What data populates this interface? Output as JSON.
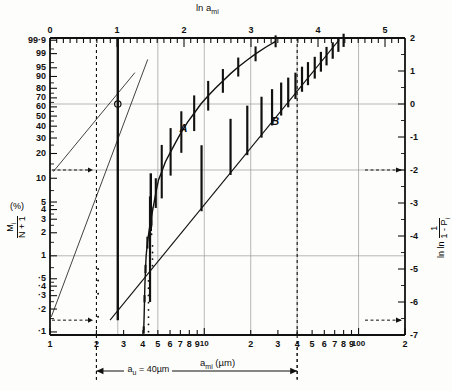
{
  "figure": {
    "top_axis_title": "ln a",
    "top_axis_title_sub": "mi",
    "bottom_axis_title": "a",
    "bottom_axis_title_sub": "mi",
    "bottom_axis_units": "(µm)",
    "left_axis_title_num": "M",
    "left_axis_title_num_sub": "i",
    "left_axis_title_den": "N + 1",
    "left_axis_title_pct": "(%)",
    "right_axis_title": "ln ln",
    "right_axis_title_num": "1",
    "right_axis_title_den": "1 - P",
    "right_axis_title_den_sub": "i",
    "annotation_label": "a",
    "annotation_label_sub": "u",
    "annotation_value": "= 40µm",
    "curve_a_label": "A",
    "curve_b_label": "B"
  },
  "chart_data": {
    "type": "scatter",
    "xlabel": "a_mi (µm)",
    "ylabel": "M_i/(N+1) (%)",
    "x_scale": "log10",
    "xlim": [
      1,
      200
    ],
    "top_xlabel": "ln a_mi",
    "top_xlim": [
      0,
      5.2983
    ],
    "right_ylabel": "ln ln (1/(1-P_i))",
    "right_ylim": [
      -7,
      2
    ],
    "grid": true,
    "legend": [
      "A",
      "B"
    ],
    "bottom_ticks_major": [
      {
        "x": 1,
        "label": "1"
      },
      {
        "x": 2,
        "label": "2"
      },
      {
        "x": 3,
        "label": "3"
      },
      {
        "x": 4,
        "label": "4"
      },
      {
        "x": 5,
        "label": "5"
      },
      {
        "x": 6,
        "label": "6"
      },
      {
        "x": 7,
        "label": "7"
      },
      {
        "x": 8,
        "label": "8"
      },
      {
        "x": 9,
        "label": "9"
      },
      {
        "x": 10,
        "label": "10"
      },
      {
        "x": 20,
        "label": "2"
      },
      {
        "x": 30,
        "label": "3"
      },
      {
        "x": 40,
        "label": "4"
      },
      {
        "x": 50,
        "label": "5"
      },
      {
        "x": 60,
        "label": "6"
      },
      {
        "x": 70,
        "label": "7"
      },
      {
        "x": 80,
        "label": "8"
      },
      {
        "x": 90,
        "label": "9"
      },
      {
        "x": 100,
        "label": "100"
      },
      {
        "x": 200,
        "label": "2"
      }
    ],
    "top_ticks_major": [
      {
        "v": 0,
        "label": "0"
      },
      {
        "v": 1,
        "label": "1"
      },
      {
        "v": 2,
        "label": "2"
      },
      {
        "v": 3,
        "label": "3"
      },
      {
        "v": 4,
        "label": "4"
      },
      {
        "v": 5,
        "label": "5"
      }
    ],
    "left_ticks": [
      {
        "p": 99.9,
        "label": "99·9"
      },
      {
        "p": 99,
        "label": "99"
      },
      {
        "p": 95,
        "label": "95"
      },
      {
        "p": 90,
        "label": "90"
      },
      {
        "p": 80,
        "label": "80"
      },
      {
        "p": 70,
        "label": "70"
      },
      {
        "p": 60,
        "label": "60"
      },
      {
        "p": 50,
        "label": "50"
      },
      {
        "p": 40,
        "label": "40"
      },
      {
        "p": 30,
        "label": "30"
      },
      {
        "p": 20,
        "label": "20"
      },
      {
        "p": 10,
        "label": "10"
      },
      {
        "p": 5,
        "label": "5"
      },
      {
        "p": 4,
        "label": "4"
      },
      {
        "p": 3,
        "label": "3"
      },
      {
        "p": 2,
        "label": "2"
      },
      {
        "p": 1,
        "label": "1"
      },
      {
        "p": 0.5,
        "label": "·5"
      },
      {
        "p": 0.4,
        "label": "·4"
      },
      {
        "p": 0.3,
        "label": "·3"
      },
      {
        "p": 0.2,
        "label": "·2"
      },
      {
        "p": 0.1,
        "label": "·1"
      }
    ],
    "right_ticks": [
      {
        "v": 2,
        "label": "2"
      },
      {
        "v": 1,
        "label": "1"
      },
      {
        "v": 0,
        "label": "0"
      },
      {
        "v": -1,
        "label": "-1"
      },
      {
        "v": -2,
        "label": "-2"
      },
      {
        "v": -3,
        "label": "-3"
      },
      {
        "v": -4,
        "label": "-4"
      },
      {
        "v": -5,
        "label": "-5"
      },
      {
        "v": -6,
        "label": "-6"
      },
      {
        "v": -7,
        "label": "-7"
      }
    ],
    "series": [
      {
        "name": "B",
        "description": "straight-line fit dataset, lower mirror radii",
        "fit_line": {
          "x1": 2.45,
          "y1": -6.55,
          "x2": 75.0,
          "y2": 1.95
        },
        "points": [
          {
            "x": 4.45,
            "w": -4.4,
            "err": 1.6
          },
          {
            "x": 9.6,
            "w": -2.25,
            "err": 1.0
          },
          {
            "x": 14.8,
            "w": -1.3,
            "err": 0.85
          },
          {
            "x": 19.0,
            "w": -0.8,
            "err": 0.75
          },
          {
            "x": 23.5,
            "w": -0.4,
            "err": 0.62
          },
          {
            "x": 27.5,
            "w": -0.1,
            "err": 0.55
          },
          {
            "x": 31.5,
            "w": 0.15,
            "err": 0.5
          },
          {
            "x": 35.0,
            "w": 0.35,
            "err": 0.45
          },
          {
            "x": 39.0,
            "w": 0.55,
            "err": 0.4
          },
          {
            "x": 43.0,
            "w": 0.75,
            "err": 0.38
          },
          {
            "x": 47.0,
            "w": 0.92,
            "err": 0.35
          },
          {
            "x": 52.0,
            "w": 1.1,
            "err": 0.33
          },
          {
            "x": 57.0,
            "w": 1.28,
            "err": 0.3
          },
          {
            "x": 62.0,
            "w": 1.45,
            "err": 0.28
          },
          {
            "x": 68.0,
            "w": 1.62,
            "err": 0.25
          },
          {
            "x": 74.0,
            "w": 1.8,
            "err": 0.22
          },
          {
            "x": 80.0,
            "w": 1.93,
            "err": 0.2
          }
        ]
      },
      {
        "name": "A",
        "description": "curved dataset, threshold near 4 µm",
        "points": [
          {
            "x": 4.05,
            "w": -6.85,
            "err": 0.12
          },
          {
            "x": 4.08,
            "w": -6.35,
            "err": 0.12
          },
          {
            "x": 4.1,
            "w": -5.9,
            "err": 0.12
          },
          {
            "x": 4.12,
            "w": -5.5,
            "err": 0.12
          },
          {
            "x": 4.16,
            "w": -5.0,
            "err": 0.14
          },
          {
            "x": 4.2,
            "w": -4.6,
            "err": 0.16
          },
          {
            "x": 4.28,
            "w": -4.2,
            "err": 0.2
          },
          {
            "x": 4.4,
            "w": -3.8,
            "err": 0.25
          },
          {
            "x": 4.55,
            "w": -3.4,
            "err": 0.3
          },
          {
            "x": 4.7,
            "w": -3.05,
            "err": 0.4
          },
          {
            "x": 4.85,
            "w": -2.7,
            "err": 0.5
          },
          {
            "x": 5.05,
            "w": -2.3,
            "err": 0.7
          },
          {
            "x": 5.3,
            "w": -2.05,
            "err": 0.9
          },
          {
            "x": 5.6,
            "w": -1.75,
            "err": 0.85
          },
          {
            "x": 6.05,
            "w": -1.45,
            "err": 0.8
          },
          {
            "x": 6.55,
            "w": -1.15,
            "err": 0.75
          },
          {
            "x": 7.1,
            "w": -0.85,
            "err": 0.7
          },
          {
            "x": 7.8,
            "w": -0.55,
            "err": 0.65
          },
          {
            "x": 8.6,
            "w": -0.28,
            "err": 0.6
          },
          {
            "x": 9.5,
            "w": 0.0,
            "err": 0.55
          },
          {
            "x": 10.6,
            "w": 0.25,
            "err": 0.5
          },
          {
            "x": 11.8,
            "w": 0.48,
            "err": 0.45
          },
          {
            "x": 13.2,
            "w": 0.7,
            "err": 0.4
          },
          {
            "x": 14.8,
            "w": 0.92,
            "err": 0.36
          },
          {
            "x": 16.6,
            "w": 1.12,
            "err": 0.32
          },
          {
            "x": 18.8,
            "w": 1.32,
            "err": 0.28
          },
          {
            "x": 21.5,
            "w": 1.52,
            "err": 0.25
          },
          {
            "x": 25.0,
            "w": 1.72,
            "err": 0.22
          },
          {
            "x": 29.0,
            "w": 1.9,
            "err": 0.2
          }
        ]
      },
      {
        "name": "reference-line",
        "description": "thin reference line from lower-left to upper region",
        "fit_line": {
          "x1": 1.02,
          "y1": -6.45,
          "x2": 4.3,
          "y2": 1.35
        }
      },
      {
        "name": "thin-left-line",
        "description": "thin line through circle marker at 2.75 µm",
        "fit_line": {
          "x1": 1.05,
          "y1": -2.05,
          "x2": 3.55,
          "y2": 0.95
        },
        "marker": {
          "x": 2.75,
          "w": 0.0
        }
      }
    ],
    "vertical_markers": [
      {
        "x": 2.75,
        "w_top": 2.0,
        "w_bottom": -6.55,
        "style": "solid"
      },
      {
        "x": 4.5,
        "w_top": -2.1,
        "w_bottom": -3.85,
        "style": "solid"
      },
      {
        "x": 2.0,
        "style": "dashed-annotation"
      },
      {
        "x": 40.0,
        "style": "dashed-annotation"
      }
    ],
    "horizontal_annotations": [
      {
        "w": -2.0,
        "side": "left",
        "style": "dashed-arrow"
      },
      {
        "w": -6.55,
        "side": "left",
        "style": "dashed-arrow"
      },
      {
        "w": -2.0,
        "side": "right",
        "style": "dashed-arrow"
      },
      {
        "w": -6.55,
        "side": "right",
        "style": "dashed-arrow"
      }
    ],
    "gridlines_h": [
      0.0,
      -2.0,
      -4.6
    ],
    "gridlines_v": [
      2.75,
      5,
      10,
      20,
      40,
      100
    ]
  }
}
